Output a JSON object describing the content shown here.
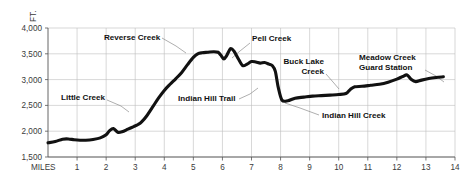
{
  "chart_data": {
    "type": "line",
    "title": "",
    "subtitle": "",
    "xlabel": "MILES",
    "ylabel": "FT.",
    "xlim": [
      0,
      14
    ],
    "ylim": [
      1500,
      4000
    ],
    "grid": true,
    "legend": "none",
    "x_ticks": [
      "1",
      "2",
      "3",
      "4",
      "5",
      "6",
      "7",
      "8",
      "9",
      "10",
      "11",
      "12",
      "13",
      "14"
    ],
    "x_tick_values": [
      1,
      2,
      3,
      4,
      5,
      6,
      7,
      8,
      9,
      10,
      11,
      12,
      13,
      14
    ],
    "y_ticks": [
      "1,500",
      "2,000",
      "2,500",
      "3,000",
      "3,500",
      "4,000"
    ],
    "y_tick_values": [
      1500,
      2000,
      2500,
      3000,
      3500,
      4000
    ],
    "series": [
      {
        "name": "Trail elevation profile",
        "color": "#111111",
        "x": [
          0.0,
          0.25,
          0.5,
          0.7,
          0.9,
          1.1,
          1.3,
          1.55,
          1.8,
          2.0,
          2.12,
          2.25,
          2.4,
          2.55,
          2.75,
          2.95,
          3.1,
          3.22,
          3.4,
          3.6,
          3.8,
          4.0,
          4.2,
          4.4,
          4.6,
          4.8,
          5.0,
          5.15,
          5.3,
          5.5,
          5.7,
          5.85,
          5.95,
          6.05,
          6.15,
          6.28,
          6.4,
          6.55,
          6.7,
          6.85,
          7.0,
          7.15,
          7.3,
          7.45,
          7.6,
          7.72,
          7.82,
          7.92,
          8.05,
          8.25,
          8.5,
          8.8,
          9.1,
          9.4,
          9.7,
          10.0,
          10.25,
          10.4,
          10.55,
          10.8,
          11.1,
          11.4,
          11.7,
          12.0,
          12.2,
          12.35,
          12.5,
          12.65,
          12.85,
          13.1,
          13.35,
          13.6
        ],
        "y": [
          1775,
          1800,
          1845,
          1850,
          1835,
          1825,
          1825,
          1840,
          1870,
          1930,
          2010,
          2050,
          1980,
          1990,
          2040,
          2090,
          2130,
          2180,
          2300,
          2470,
          2640,
          2790,
          2910,
          3020,
          3140,
          3290,
          3430,
          3500,
          3520,
          3530,
          3540,
          3530,
          3470,
          3400,
          3470,
          3600,
          3550,
          3400,
          3270,
          3300,
          3350,
          3340,
          3320,
          3330,
          3300,
          3270,
          3160,
          2850,
          2600,
          2590,
          2640,
          2660,
          2680,
          2690,
          2700,
          2710,
          2730,
          2810,
          2860,
          2870,
          2890,
          2910,
          2950,
          3010,
          3060,
          3090,
          3000,
          2960,
          2990,
          3020,
          3040,
          3055
        ]
      }
    ],
    "annotations": [
      {
        "id": "little-creek",
        "label": "Little Creek",
        "lines": [
          "Little Creek"
        ],
        "text_x": 61,
        "text_y": 100,
        "align": "start",
        "leader": [
          [
            107,
            100
          ],
          [
            121,
            106
          ],
          [
            129,
            112
          ]
        ]
      },
      {
        "id": "reverse-creek",
        "label": "Reverse Creek",
        "lines": [
          "Reverse Creek"
        ],
        "text_x": 104,
        "text_y": 40,
        "align": "start",
        "leader": [
          [
            162,
            38
          ],
          [
            176,
            46
          ],
          [
            186,
            53
          ]
        ]
      },
      {
        "id": "indian-hill-trail",
        "label": "Indian Hill Trail",
        "lines": [
          "Indian Hill Trail"
        ],
        "text_x": 178,
        "text_y": 101,
        "align": "start",
        "leader": [
          [
            239,
            99
          ],
          [
            250,
            94
          ],
          [
            258,
            88
          ]
        ]
      },
      {
        "id": "pell-creek",
        "label": "Pell Creek",
        "lines": [
          "Pell Creek"
        ],
        "text_x": 252,
        "text_y": 41,
        "align": "start",
        "leader": [
          [
            250,
            43
          ],
          [
            240,
            51
          ],
          [
            232,
            58
          ]
        ]
      },
      {
        "id": "buck-lake-creek",
        "label": "Buck Lake Creek",
        "lines": [
          "Buck Lake",
          "Creek"
        ],
        "text_x": 324,
        "text_y": 64,
        "align": "end",
        "leader": [
          [
            326,
            74
          ],
          [
            333,
            82
          ],
          [
            339,
            89
          ]
        ]
      },
      {
        "id": "indian-hill-creek",
        "label": "Indian Hill Creek",
        "lines": [
          "Indian Hill Creek"
        ],
        "text_x": 322,
        "text_y": 118,
        "align": "start",
        "leader": [
          [
            319,
            115
          ],
          [
            300,
            108
          ],
          [
            285,
            103
          ]
        ]
      },
      {
        "id": "meadow-creek-guard-station",
        "label": "Meadow Creek Guard Station",
        "lines": [
          "Meadow Creek",
          "Guard Station"
        ],
        "text_x": 359,
        "text_y": 60,
        "align": "start",
        "leader": [
          [
            425,
            70
          ],
          [
            436,
            76
          ],
          [
            444,
            82
          ]
        ]
      }
    ]
  },
  "colors": {
    "line": "#111111",
    "grid": "#bdbdbd",
    "axis": "#555555",
    "text": "#3a3a3a",
    "annotation_text": "#111111",
    "leader": "#8c8c8c",
    "background": "#ffffff"
  }
}
